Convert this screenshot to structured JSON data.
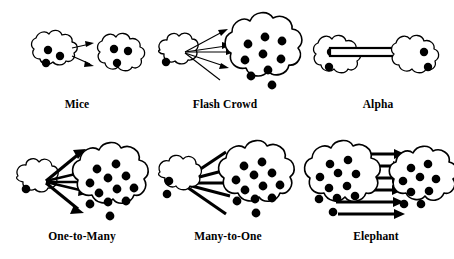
{
  "figure": {
    "background_color": "#ffffff",
    "ink_color": "#000000",
    "width": 454,
    "height": 259,
    "rows": 2,
    "columns": 3
  },
  "panels": [
    {
      "id": "mice",
      "label": "Mice",
      "row": 1,
      "column": 1,
      "source": {
        "shape": "cloud",
        "size": "small",
        "dot_count": 3
      },
      "target": {
        "shape": "cloud",
        "size": "small",
        "dot_count": 3
      },
      "flows": {
        "count": 2,
        "weight": "thin",
        "direction": "left-to-right",
        "style": "parallel-arrows"
      }
    },
    {
      "id": "flash-crowd",
      "label": "Flash Crowd",
      "row": 1,
      "column": 2,
      "source": {
        "shape": "cloud",
        "size": "small",
        "dot_count": 1
      },
      "target": {
        "shape": "cloud",
        "size": "large",
        "dot_count": 9
      },
      "flows": {
        "count": 5,
        "weight": "thin",
        "direction": "left-to-right",
        "style": "fan-out"
      }
    },
    {
      "id": "alpha",
      "label": "Alpha",
      "row": 1,
      "column": 3,
      "source": {
        "shape": "cloud",
        "size": "small",
        "dot_count": 2
      },
      "target": {
        "shape": "cloud",
        "size": "small",
        "dot_count": 2
      },
      "flows": {
        "count": 1,
        "weight": "very-thick-band",
        "direction": "left-to-right",
        "style": "single-wide-arrow"
      }
    },
    {
      "id": "one-to-many",
      "label": "One-to-Many",
      "row": 2,
      "column": 1,
      "source": {
        "shape": "cloud",
        "size": "small",
        "dot_count": 1
      },
      "target": {
        "shape": "cloud",
        "size": "large",
        "dot_count": 12
      },
      "flows": {
        "count": 5,
        "weight": "thick",
        "direction": "left-to-right",
        "style": "fan-out"
      }
    },
    {
      "id": "many-to-one",
      "label": "Many-to-One",
      "row": 2,
      "column": 2,
      "source": {
        "shape": "cloud",
        "size": "large",
        "dot_count": 12
      },
      "target": {
        "shape": "cloud",
        "size": "small",
        "dot_count": 2
      },
      "flows": {
        "count": 5,
        "weight": "thick",
        "direction": "right-to-left",
        "style": "fan-in"
      }
    },
    {
      "id": "elephant",
      "label": "Elephant",
      "row": 2,
      "column": 3,
      "source": {
        "shape": "cloud",
        "size": "large",
        "dot_count": 11
      },
      "target": {
        "shape": "cloud",
        "size": "medium",
        "dot_count": 9
      },
      "flows": {
        "count": 6,
        "weight": "thick",
        "direction": "left-to-right",
        "style": "parallel-arrows"
      }
    }
  ]
}
